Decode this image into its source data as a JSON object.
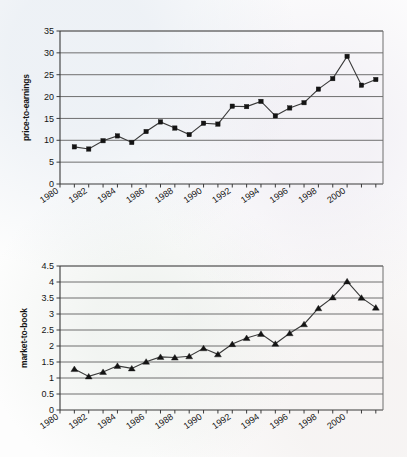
{
  "figure": {
    "background_color": "#fdfdfd",
    "line_color": "#3a3a3a",
    "grid_color": "#6f6f6f",
    "marker_color": "#141414"
  },
  "chart_data": [
    {
      "id": "price-to-earnings",
      "type": "line",
      "title": "",
      "xlabel": "",
      "ylabel": "price-to-earnings",
      "marker": "square",
      "grid": true,
      "legend": false,
      "xlim": [
        1980,
        2002.5
      ],
      "ylim": [
        0,
        35
      ],
      "yticks": [
        0,
        5,
        10,
        15,
        20,
        25,
        30,
        35
      ],
      "ytick_labels": [
        "0",
        "5",
        "10",
        "15",
        "20",
        "25",
        "30",
        "35"
      ],
      "xticks": [
        1980,
        1981,
        1982,
        1983,
        1984,
        1985,
        1986,
        1987,
        1988,
        1989,
        1990,
        1991,
        1992,
        1993,
        1994,
        1995,
        1996,
        1997,
        1998,
        1999,
        2000,
        2001,
        2002
      ],
      "xtick_labels": [
        "1980",
        "1982",
        "1984",
        "1986",
        "1988",
        "1990",
        "1992",
        "1994",
        "1996",
        "1998",
        "2000"
      ],
      "xtick_label_years": [
        1980,
        1982,
        1984,
        1986,
        1988,
        1990,
        1992,
        1994,
        1996,
        1998,
        2000
      ],
      "x": [
        1981,
        1982,
        1983,
        1984,
        1985,
        1986,
        1987,
        1988,
        1989,
        1990,
        1991,
        1992,
        1993,
        1994,
        1995,
        1996,
        1997,
        1998,
        1999,
        2000,
        2001,
        2002
      ],
      "values": [
        8.5,
        8.0,
        9.9,
        11.0,
        9.5,
        12.0,
        14.2,
        12.8,
        11.3,
        13.9,
        13.7,
        17.8,
        17.7,
        18.9,
        15.6,
        17.4,
        18.6,
        21.7,
        24.1,
        29.2,
        22.6,
        23.9
      ]
    },
    {
      "id": "market-to-book",
      "type": "line",
      "title": "",
      "xlabel": "",
      "ylabel": "market-to-book",
      "marker": "triangle",
      "grid": true,
      "legend": false,
      "xlim": [
        1980,
        2002.5
      ],
      "ylim": [
        0,
        4.5
      ],
      "yticks": [
        0,
        0.5,
        1,
        1.5,
        2,
        2.5,
        3,
        3.5,
        4,
        4.5
      ],
      "ytick_labels": [
        "0",
        "0.5",
        "1",
        "1.5",
        "2",
        "2.5",
        "3",
        "3.5",
        "4",
        "4.5"
      ],
      "xticks": [
        1980,
        1981,
        1982,
        1983,
        1984,
        1985,
        1986,
        1987,
        1988,
        1989,
        1990,
        1991,
        1992,
        1993,
        1994,
        1995,
        1996,
        1997,
        1998,
        1999,
        2000,
        2001,
        2002
      ],
      "xtick_labels": [
        "1980",
        "1982",
        "1984",
        "1986",
        "1988",
        "1990",
        "1992",
        "1994",
        "1996",
        "1998",
        "2000"
      ],
      "xtick_label_years": [
        1980,
        1982,
        1984,
        1986,
        1988,
        1990,
        1992,
        1994,
        1996,
        1998,
        2000
      ],
      "x": [
        1981,
        1982,
        1983,
        1984,
        1985,
        1986,
        1987,
        1988,
        1989,
        1990,
        1991,
        1992,
        1993,
        1994,
        1995,
        1996,
        1997,
        1998,
        1999,
        2000,
        2001,
        2002
      ],
      "values": [
        1.28,
        1.05,
        1.19,
        1.38,
        1.3,
        1.51,
        1.66,
        1.64,
        1.68,
        1.93,
        1.74,
        2.06,
        2.25,
        2.38,
        2.07,
        2.4,
        2.68,
        3.18,
        3.52,
        4.02,
        3.51,
        3.2
      ]
    }
  ]
}
